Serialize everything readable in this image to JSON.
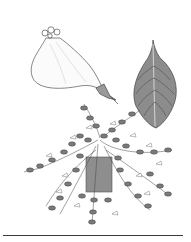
{
  "image": {
    "subject": "botanical illustration of a trailing hanging plant",
    "panels": [
      {
        "name": "flower-detail",
        "description": "tubular pouch-shaped flower with calyx"
      },
      {
        "name": "leaf-detail",
        "description": "single ovate leaf with pointed tip, shaded gray"
      },
      {
        "name": "potted-plant",
        "description": "trailing plant with small leaves and flowers spilling from a gray pot"
      }
    ],
    "colors": {
      "background": "#ffffff",
      "line": "#3a3a3a",
      "leaf_fill": "#8c8c8c",
      "leaf_dark": "#5e5e5e",
      "pot_fill": "#8e8e8e",
      "foliage": "#7a7a7a"
    }
  }
}
